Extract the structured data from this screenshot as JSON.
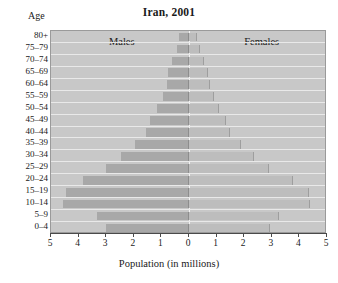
{
  "chart_data": {
    "type": "bar",
    "subtype": "population-pyramid",
    "title": "Iran, 2001",
    "xlabel": "Population (in millions)",
    "ylabel": "Age",
    "grid": false,
    "legend_position": "inside-top",
    "xlim": [
      -5,
      5
    ],
    "xticks": [
      5,
      4,
      3,
      2,
      1,
      0,
      1,
      2,
      3,
      4,
      5
    ],
    "xtick_labels": [
      "5",
      "4",
      "3",
      "2",
      "1",
      "0",
      "1",
      "2",
      "3",
      "4",
      "5"
    ],
    "categories": [
      "80+",
      "75–79",
      "70–74",
      "65–69",
      "60–64",
      "55–59",
      "50–54",
      "45–49",
      "40–44",
      "35–39",
      "30–34",
      "25–29",
      "20–24",
      "15–19",
      "10–14",
      "5–9",
      "0–4"
    ],
    "series": [
      {
        "name": "Males",
        "side": "left",
        "color": "#a8a8a8",
        "values": [
          0.35,
          0.45,
          0.6,
          0.75,
          0.8,
          0.95,
          1.15,
          1.4,
          1.55,
          1.95,
          2.45,
          3.0,
          3.85,
          4.45,
          4.55,
          3.35,
          3.0
        ]
      },
      {
        "name": "Females",
        "side": "right",
        "color": "#bdbdbd",
        "values": [
          0.3,
          0.4,
          0.55,
          0.7,
          0.75,
          0.9,
          1.1,
          1.35,
          1.5,
          1.9,
          2.35,
          2.9,
          3.75,
          4.35,
          4.4,
          3.25,
          2.95
        ]
      }
    ]
  },
  "labels": {
    "age_caption": "Age",
    "males": "Males",
    "females": "Females"
  }
}
